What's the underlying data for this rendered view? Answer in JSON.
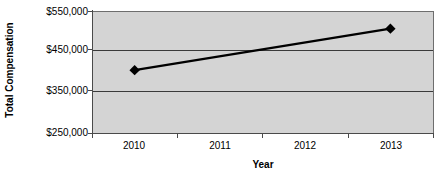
{
  "chart_data": {
    "type": "line",
    "title": "",
    "xlabel": "Year",
    "ylabel": "Total Compensation",
    "categories": [
      "2010",
      "2011",
      "2012",
      "2013"
    ],
    "series": [
      {
        "name": "Total Compensation",
        "values": [
          407000,
          null,
          null,
          509000
        ]
      }
    ],
    "ylim": [
      250000,
      550000
    ],
    "ytick_values": [
      550000,
      450000,
      350000,
      250000
    ],
    "ytick_labels": [
      "$550,000",
      "$450,000",
      "$350,000",
      "$250,000"
    ],
    "grid": "horizontal",
    "legend": "none",
    "marker": "diamond",
    "line_color": "#000000",
    "plot_background": "#d4d4d4",
    "gridline_color": "#3a3a3a",
    "axis_color": "#4a4a4a",
    "page_background": "#ffffff"
  },
  "axes": {
    "y_title": "Total Compensation",
    "x_title": "Year",
    "y_ticks": [
      {
        "label": "$550,000",
        "value": 550000
      },
      {
        "label": "$450,000",
        "value": 450000
      },
      {
        "label": "$350,000",
        "value": 350000
      },
      {
        "label": "$250,000",
        "value": 250000
      }
    ],
    "x_ticks": [
      {
        "label": "2010"
      },
      {
        "label": "2011"
      },
      {
        "label": "2012"
      },
      {
        "label": "2013"
      }
    ]
  }
}
